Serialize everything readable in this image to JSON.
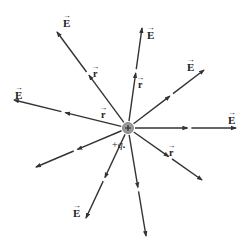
{
  "diagram": {
    "center": {
      "x": 128,
      "y": 128
    },
    "charge": {
      "label": "+q",
      "sign": "+",
      "color": "#9a9a9a"
    },
    "line_color": "#333333",
    "field_label": "E",
    "radius_label": "r",
    "vector_arrow": "→",
    "rays": [
      {
        "id": "up-left",
        "x": 57,
        "y": 32
      },
      {
        "id": "up",
        "x": 142,
        "y": 28
      },
      {
        "id": "up-right",
        "x": 204,
        "y": 70
      },
      {
        "id": "right",
        "x": 236,
        "y": 128
      },
      {
        "id": "left",
        "x": 14,
        "y": 100
      },
      {
        "id": "lower-left",
        "x": 36,
        "y": 167
      },
      {
        "id": "down-left",
        "x": 86,
        "y": 218
      },
      {
        "id": "down",
        "x": 146,
        "y": 236
      },
      {
        "id": "lower-right",
        "x": 202,
        "y": 180
      }
    ],
    "E_labels": [
      {
        "x": 63,
        "y": 14
      },
      {
        "x": 147,
        "y": 26
      },
      {
        "x": 187,
        "y": 58
      },
      {
        "x": 228,
        "y": 111
      },
      {
        "x": 15,
        "y": 86
      },
      {
        "x": 73,
        "y": 204
      }
    ],
    "r_labels": [
      {
        "x": 93,
        "y": 65
      },
      {
        "x": 138,
        "y": 76
      },
      {
        "x": 101,
        "y": 106
      },
      {
        "x": 169,
        "y": 144
      }
    ],
    "charge_label_pos": {
      "x": 112,
      "y": 139
    }
  }
}
